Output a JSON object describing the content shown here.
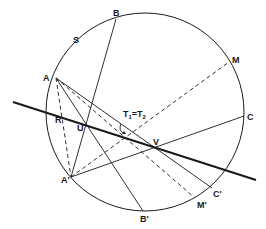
{
  "colors": {
    "ink": "#1a1a1a",
    "background": "#ffffff"
  },
  "circle": {
    "cx": 145,
    "cy": 112,
    "r": 99
  },
  "points": {
    "A": {
      "x": 56,
      "y": 78,
      "label": "A",
      "lx": 43,
      "ly": 81
    },
    "B": {
      "x": 116,
      "y": 19,
      "label": "B",
      "lx": 113,
      "ly": 16
    },
    "S": {
      "label": "S",
      "lx": 73,
      "ly": 43
    },
    "M": {
      "x": 229,
      "y": 62,
      "label": "M",
      "lx": 232,
      "ly": 63
    },
    "C": {
      "x": 244,
      "y": 116,
      "label": "C",
      "lx": 247,
      "ly": 120
    },
    "C'": {
      "x": 212,
      "y": 188,
      "label": "C'",
      "lx": 213,
      "ly": 197
    },
    "M'": {
      "x": 195,
      "y": 198,
      "label": "M'",
      "lx": 197,
      "ly": 208
    },
    "B'": {
      "x": 143,
      "y": 211,
      "label": "B'",
      "lx": 140,
      "ly": 222
    },
    "A'": {
      "x": 71,
      "y": 177,
      "label": "A'",
      "lx": 61,
      "ly": 183
    },
    "R": {
      "x": 61,
      "y": 117,
      "label": "R",
      "lx": 55,
      "ly": 123
    },
    "U": {
      "x": 86,
      "y": 125,
      "label": "U",
      "lx": 77,
      "ly": 131
    },
    "V": {
      "x": 157,
      "y": 148,
      "label": "V",
      "lx": 153,
      "ly": 145
    }
  },
  "angle_label": {
    "text_main": "T",
    "sub1": "1",
    "eq": "=",
    "sub2": "2",
    "x": 123,
    "y": 117
  },
  "thick_line": {
    "x1": 13,
    "y1": 102,
    "x2": 256,
    "y2": 180
  }
}
